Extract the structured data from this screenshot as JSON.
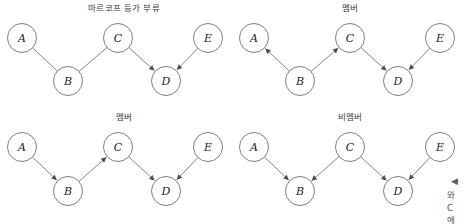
{
  "figure": {
    "width": 464,
    "height": 224,
    "background_color": "#ffffff",
    "node_stroke_color": "#6e6e76",
    "edge_color": "#6e6e76",
    "arrow_color": "#4a4a52",
    "title_color": "#3a3a3a",
    "label_color": "#1b1b1b"
  },
  "panels": [
    {
      "id": "markov-equivalence-class",
      "title": "마르코프 등가 부류",
      "title_x": 124,
      "title_y": 11,
      "origin_x": 0,
      "origin_y": 0,
      "nodes": [
        {
          "id": "A",
          "label": "A",
          "cx": 22,
          "cy": 38
        },
        {
          "id": "B",
          "label": "B",
          "cx": 68,
          "cy": 81
        },
        {
          "id": "C",
          "label": "C",
          "cx": 118,
          "cy": 38
        },
        {
          "id": "D",
          "label": "D",
          "cx": 166,
          "cy": 81
        },
        {
          "id": "E",
          "label": "E",
          "cx": 208,
          "cy": 38
        }
      ],
      "edges": [
        {
          "from": "A",
          "to": "B",
          "directed": false
        },
        {
          "from": "C",
          "to": "B",
          "directed": false
        },
        {
          "from": "C",
          "to": "D",
          "directed": true
        },
        {
          "from": "E",
          "to": "D",
          "directed": true
        }
      ]
    },
    {
      "id": "member-top-right",
      "title": "멤버",
      "title_x": 350,
      "title_y": 11,
      "origin_x": 232,
      "origin_y": 0,
      "nodes": [
        {
          "id": "A",
          "label": "A",
          "cx": 254,
          "cy": 38
        },
        {
          "id": "B",
          "label": "B",
          "cx": 300,
          "cy": 81
        },
        {
          "id": "C",
          "label": "C",
          "cx": 350,
          "cy": 38
        },
        {
          "id": "D",
          "label": "D",
          "cx": 398,
          "cy": 81
        },
        {
          "id": "E",
          "label": "E",
          "cx": 440,
          "cy": 38
        }
      ],
      "edges": [
        {
          "from": "B",
          "to": "A",
          "directed": true
        },
        {
          "from": "B",
          "to": "C",
          "directed": true
        },
        {
          "from": "C",
          "to": "D",
          "directed": true
        },
        {
          "from": "E",
          "to": "D",
          "directed": true
        }
      ]
    },
    {
      "id": "member-bottom-left",
      "title": "멤버",
      "title_x": 124,
      "title_y": 120,
      "origin_x": 0,
      "origin_y": 112,
      "nodes": [
        {
          "id": "A",
          "label": "A",
          "cx": 22,
          "cy": 147
        },
        {
          "id": "B",
          "label": "B",
          "cx": 68,
          "cy": 191
        },
        {
          "id": "C",
          "label": "C",
          "cx": 118,
          "cy": 147
        },
        {
          "id": "D",
          "label": "D",
          "cx": 166,
          "cy": 191
        },
        {
          "id": "E",
          "label": "E",
          "cx": 208,
          "cy": 147
        }
      ],
      "edges": [
        {
          "from": "A",
          "to": "B",
          "directed": true
        },
        {
          "from": "B",
          "to": "C",
          "directed": true
        },
        {
          "from": "C",
          "to": "D",
          "directed": true
        },
        {
          "from": "E",
          "to": "D",
          "directed": true
        }
      ]
    },
    {
      "id": "non-member-bottom-right",
      "title": "비멤버",
      "title_x": 350,
      "title_y": 120,
      "origin_x": 232,
      "origin_y": 112,
      "nodes": [
        {
          "id": "A",
          "label": "A",
          "cx": 254,
          "cy": 147
        },
        {
          "id": "B",
          "label": "B",
          "cx": 300,
          "cy": 191
        },
        {
          "id": "C",
          "label": "C",
          "cx": 350,
          "cy": 147
        },
        {
          "id": "D",
          "label": "D",
          "cx": 398,
          "cy": 191
        },
        {
          "id": "E",
          "label": "E",
          "cx": 440,
          "cy": 147
        }
      ],
      "edges": [
        {
          "from": "A",
          "to": "B",
          "directed": true
        },
        {
          "from": "C",
          "to": "B",
          "directed": true
        },
        {
          "from": "C",
          "to": "D",
          "directed": true
        },
        {
          "from": "E",
          "to": "D",
          "directed": true
        }
      ]
    }
  ],
  "side_note": {
    "marker": "◀",
    "marker_x": 451,
    "marker_y": 184,
    "lines": [
      {
        "text": "와",
        "x": 447,
        "y": 198
      },
      {
        "text": "C",
        "x": 447,
        "y": 211
      },
      {
        "text": "에",
        "x": 447,
        "y": 223
      }
    ]
  },
  "node_radius": 14.5
}
